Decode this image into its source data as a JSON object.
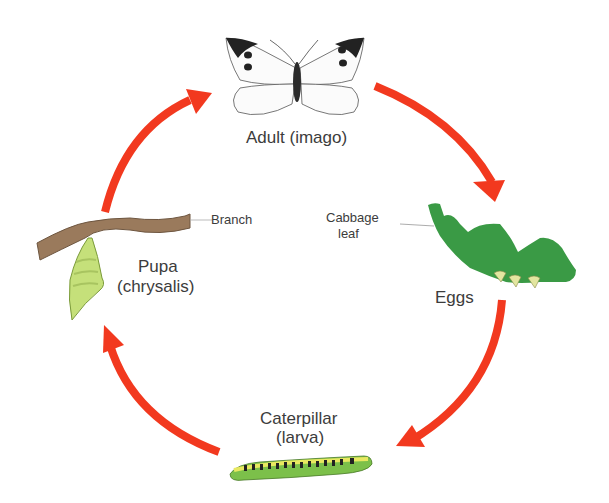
{
  "diagram": {
    "colors": {
      "arrow": "#f2391f",
      "leaf": "#3a9a45",
      "egg": "#e3e6a0",
      "branch": "#9a7a5c",
      "pupa": "#c5e07a",
      "caterpillar_green": "#7cc04a",
      "caterpillar_yellow": "#e8e860",
      "text": "#3c3c3c"
    },
    "stages": [
      {
        "id": "adult",
        "label": "Adult (imago)"
      },
      {
        "id": "eggs",
        "label": "Eggs",
        "annotation_line1": "Cabbage",
        "annotation_line2": "leaf"
      },
      {
        "id": "larva",
        "label_line1": "Caterpillar",
        "label_line2": "(larva)"
      },
      {
        "id": "pupa",
        "label_line1": "Pupa",
        "label_line2": "(chrysalis)",
        "annotation": "Branch"
      }
    ],
    "arrows": [
      {
        "from": "adult",
        "to": "eggs"
      },
      {
        "from": "eggs",
        "to": "larva"
      },
      {
        "from": "larva",
        "to": "pupa"
      },
      {
        "from": "pupa",
        "to": "adult"
      }
    ]
  }
}
